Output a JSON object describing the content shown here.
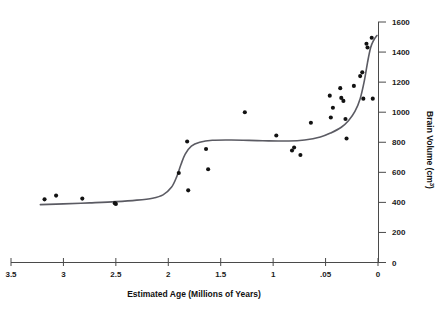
{
  "chart_data": {
    "type": "scatter",
    "title": "",
    "xlabel": "Estimated Age (Millions of Years)",
    "ylabel": "Brain Volume (cm³)",
    "ylabel_text": "Brain Volume (cm",
    "ylabel_sup": "3",
    "ylabel_close": ")",
    "xlim": [
      3.5,
      0
    ],
    "ylim": [
      0,
      1600
    ],
    "x_reversed": true,
    "grid": false,
    "legend": "none",
    "x_ticks": [
      3.5,
      3,
      2.5,
      2,
      1.5,
      1,
      0.5,
      0
    ],
    "x_tick_labels": [
      "3.5",
      "3",
      "2.5",
      "2",
      "1.5",
      "1",
      ".05",
      "0"
    ],
    "y_ticks": [
      0,
      200,
      400,
      600,
      800,
      1000,
      1200,
      1400,
      1600
    ],
    "y_tick_labels": [
      "0",
      "200",
      "400",
      "600",
      "800",
      "1000",
      "1200",
      "1400",
      "1600"
    ],
    "y_axis_position": "right",
    "points": [
      {
        "x": 3.18,
        "y": 420
      },
      {
        "x": 3.07,
        "y": 445
      },
      {
        "x": 2.82,
        "y": 425
      },
      {
        "x": 2.51,
        "y": 395
      },
      {
        "x": 2.5,
        "y": 390
      },
      {
        "x": 1.9,
        "y": 595
      },
      {
        "x": 1.82,
        "y": 805
      },
      {
        "x": 1.81,
        "y": 480
      },
      {
        "x": 1.64,
        "y": 755
      },
      {
        "x": 1.62,
        "y": 620
      },
      {
        "x": 1.27,
        "y": 1000
      },
      {
        "x": 0.97,
        "y": 845
      },
      {
        "x": 0.82,
        "y": 745
      },
      {
        "x": 0.8,
        "y": 765
      },
      {
        "x": 0.74,
        "y": 715
      },
      {
        "x": 0.64,
        "y": 930
      },
      {
        "x": 0.46,
        "y": 1110
      },
      {
        "x": 0.45,
        "y": 965
      },
      {
        "x": 0.43,
        "y": 1030
      },
      {
        "x": 0.36,
        "y": 1160
      },
      {
        "x": 0.35,
        "y": 1095
      },
      {
        "x": 0.33,
        "y": 1075
      },
      {
        "x": 0.31,
        "y": 955
      },
      {
        "x": 0.3,
        "y": 825
      },
      {
        "x": 0.23,
        "y": 1175
      },
      {
        "x": 0.17,
        "y": 1240
      },
      {
        "x": 0.15,
        "y": 1265
      },
      {
        "x": 0.14,
        "y": 1090
      },
      {
        "x": 0.11,
        "y": 1455
      },
      {
        "x": 0.1,
        "y": 1430
      },
      {
        "x": 0.06,
        "y": 1495
      },
      {
        "x": 0.05,
        "y": 1090
      }
    ],
    "fit_curve": {
      "label": "fitted stepwise trend",
      "points": [
        {
          "x": 3.22,
          "y": 385
        },
        {
          "x": 3.0,
          "y": 390
        },
        {
          "x": 2.75,
          "y": 397
        },
        {
          "x": 2.5,
          "y": 405
        },
        {
          "x": 2.3,
          "y": 415
        },
        {
          "x": 2.15,
          "y": 428
        },
        {
          "x": 2.05,
          "y": 450
        },
        {
          "x": 1.97,
          "y": 500
        },
        {
          "x": 1.92,
          "y": 570
        },
        {
          "x": 1.88,
          "y": 650
        },
        {
          "x": 1.84,
          "y": 720
        },
        {
          "x": 1.78,
          "y": 775
        },
        {
          "x": 1.7,
          "y": 800
        },
        {
          "x": 1.58,
          "y": 813
        },
        {
          "x": 1.4,
          "y": 815
        },
        {
          "x": 1.1,
          "y": 810
        },
        {
          "x": 0.85,
          "y": 808
        },
        {
          "x": 0.7,
          "y": 815
        },
        {
          "x": 0.55,
          "y": 835
        },
        {
          "x": 0.45,
          "y": 862
        },
        {
          "x": 0.35,
          "y": 900
        },
        {
          "x": 0.28,
          "y": 945
        },
        {
          "x": 0.22,
          "y": 1005
        },
        {
          "x": 0.17,
          "y": 1090
        },
        {
          "x": 0.13,
          "y": 1210
        },
        {
          "x": 0.1,
          "y": 1330
        },
        {
          "x": 0.07,
          "y": 1430
        },
        {
          "x": 0.04,
          "y": 1480
        },
        {
          "x": 0.01,
          "y": 1510
        }
      ]
    }
  }
}
